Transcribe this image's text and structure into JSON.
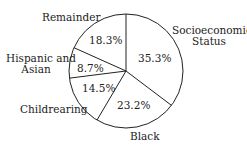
{
  "chart_data": {
    "type": "pie",
    "title": "",
    "slices": [
      {
        "label": "Socioeconomic Status",
        "value": 35.3,
        "display": "35.3%"
      },
      {
        "label": "Black",
        "value": 23.2,
        "display": "23.2%"
      },
      {
        "label": "Childrearing",
        "value": 14.5,
        "display": "14.5%"
      },
      {
        "label": "Hispanic and Asian",
        "value": 8.7,
        "display": "8.7%"
      },
      {
        "label": "Remainder",
        "value": 18.3,
        "display": "18.3%"
      }
    ],
    "start_angle": "12 o'clock, clockwise",
    "legend": "none (external labels)"
  },
  "labels": {
    "socio_line1": "Socioeconomic",
    "socio_line2": "Status",
    "black": "Black",
    "childrearing": "Childrearing",
    "hispanic_line1": "Hispanic and",
    "hispanic_line2": "Asian",
    "remainder": "Remainder"
  }
}
